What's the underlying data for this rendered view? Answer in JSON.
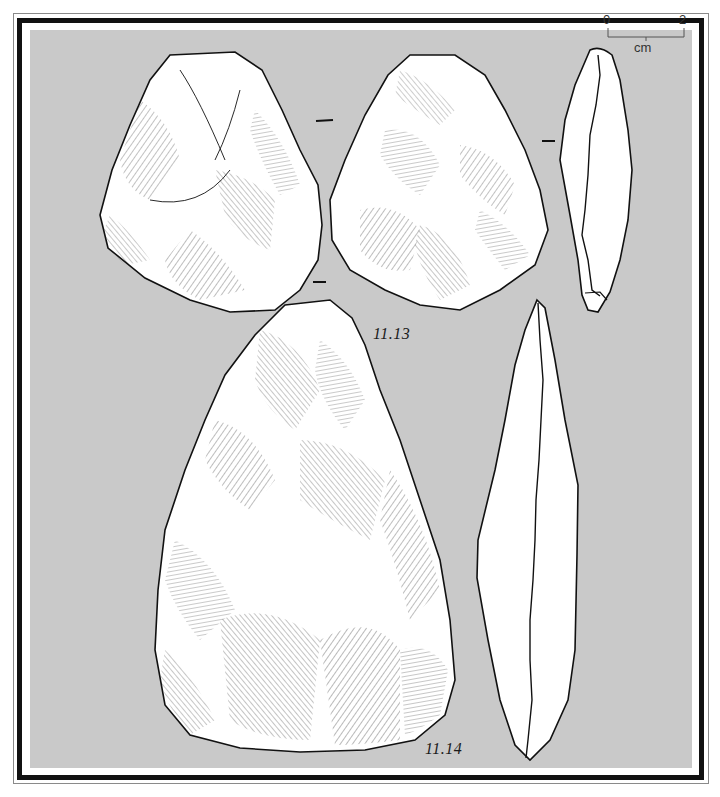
{
  "figure": {
    "background_color": "#c9c9c9",
    "frame_color": "#111111",
    "artifacts": [
      {
        "id": "11.13",
        "label": "11.13",
        "views": [
          "dorsal face",
          "ventral face",
          "profile"
        ]
      },
      {
        "id": "11.14",
        "label": "11.14",
        "views": [
          "face",
          "profile"
        ]
      }
    ],
    "scale_bar": {
      "start_label": "0",
      "end_label": "2",
      "unit_label": "cm"
    }
  }
}
